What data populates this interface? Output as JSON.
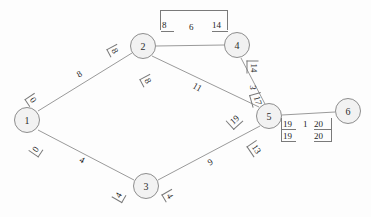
{
  "diagram": {
    "background": "#fdfdfd",
    "node_fill": "#f2f2f2",
    "node_stroke": "#8d8d8d",
    "edge_stroke": "#9a9a9a",
    "text_color": "#1d1d1d"
  },
  "nodes": [
    {
      "id": "1",
      "label": "1",
      "x": 27,
      "y": 120
    },
    {
      "id": "2",
      "label": "2",
      "x": 143,
      "y": 46
    },
    {
      "id": "3",
      "label": "3",
      "x": 146,
      "y": 186
    },
    {
      "id": "4",
      "label": "4",
      "x": 237,
      "y": 45
    },
    {
      "id": "5",
      "label": "5",
      "x": 269,
      "y": 116
    },
    {
      "id": "6",
      "label": "6",
      "x": 348,
      "y": 111
    }
  ],
  "edges": [
    {
      "from": "1",
      "to": "2",
      "weight": "8"
    },
    {
      "from": "1",
      "to": "3",
      "weight": "4"
    },
    {
      "from": "2",
      "to": "4",
      "weight": "6"
    },
    {
      "from": "2",
      "to": "5",
      "weight": "11"
    },
    {
      "from": "3",
      "to": "5",
      "weight": "9"
    },
    {
      "from": "4",
      "to": "5",
      "weight": "3"
    },
    {
      "from": "5",
      "to": "6",
      "weight": "1"
    }
  ],
  "edge_weight_labels": [
    {
      "name": "weight-1-2",
      "text": "8",
      "x": 77,
      "y": 69,
      "rot": -32
    },
    {
      "name": "weight-1-3",
      "text": "4",
      "x": 80,
      "y": 155,
      "rot": 28
    },
    {
      "name": "weight-2-5",
      "text": "11",
      "x": 193,
      "y": 82,
      "rot": 30
    },
    {
      "name": "weight-3-5",
      "text": "9",
      "x": 208,
      "y": 157,
      "rot": -30
    }
  ],
  "annotations": [
    {
      "name": "anno-node1-upper",
      "text": "0",
      "x": 30,
      "y": 89,
      "rot": 56,
      "side": "left"
    },
    {
      "name": "anno-node1-lower",
      "text": "0",
      "x": 29,
      "y": 140,
      "rot": -56,
      "side": "left"
    },
    {
      "name": "anno-node2-left",
      "text": "8",
      "x": 112,
      "y": 40,
      "rot": 62,
      "side": "left"
    },
    {
      "name": "anno-node2-lower",
      "text": "8",
      "x": 145,
      "y": 70,
      "rot": 62,
      "side": "left"
    },
    {
      "name": "anno-node3-left",
      "text": "4",
      "x": 112,
      "y": 186,
      "rot": -60,
      "side": "left"
    },
    {
      "name": "anno-node3-right",
      "text": "4",
      "x": 167,
      "y": 185,
      "rot": 60,
      "side": "left"
    },
    {
      "name": "anno-node5-2side",
      "text": "19",
      "x": 226,
      "y": 110,
      "rot": -42,
      "side": "left"
    },
    {
      "name": "anno-node5-3side",
      "text": "13",
      "x": 251,
      "y": 138,
      "rot": 56,
      "side": "left"
    },
    {
      "name": "anno-edge45-top",
      "text": "14",
      "x": 249,
      "y": 58,
      "rot": 90,
      "side": "left"
    },
    {
      "name": "anno-edge45-mid",
      "text": "3",
      "x": 251,
      "y": 78,
      "rot": 90,
      "side": "none"
    },
    {
      "name": "anno-edge45-bot",
      "text": "17",
      "x": 253,
      "y": 90,
      "rot": 74,
      "side": "left"
    }
  ],
  "top_bracket_group": {
    "name": "bracket-2-4",
    "values": [
      {
        "name": "bracket-value-left",
        "text": "8"
      },
      {
        "name": "bracket-value-middle",
        "text": "6"
      },
      {
        "name": "bracket-value-right",
        "text": "14"
      }
    ]
  },
  "node56_table": {
    "name": "table-5-6",
    "rows": [
      [
        "19",
        "1",
        "20"
      ],
      [
        "19",
        "",
        "20"
      ]
    ]
  }
}
